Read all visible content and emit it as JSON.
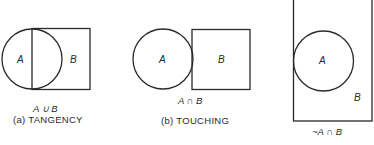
{
  "panels": [
    {
      "id": "a",
      "expression": "A ∪ B",
      "caption": "(a)  TANGENCY",
      "labels": {
        "circle": "A",
        "rect": "B"
      }
    },
    {
      "id": "b",
      "expression": "A ∩ B",
      "caption": "(b)  TOUCHING",
      "labels": {
        "circle": "A",
        "rect": "B"
      }
    },
    {
      "id": "c",
      "expression": "~A ∩ B",
      "caption": "",
      "labels": {
        "circle": "A",
        "rect": "B"
      }
    }
  ],
  "colors": {
    "stroke": "#2a2a2a",
    "background": "#ffffff"
  }
}
